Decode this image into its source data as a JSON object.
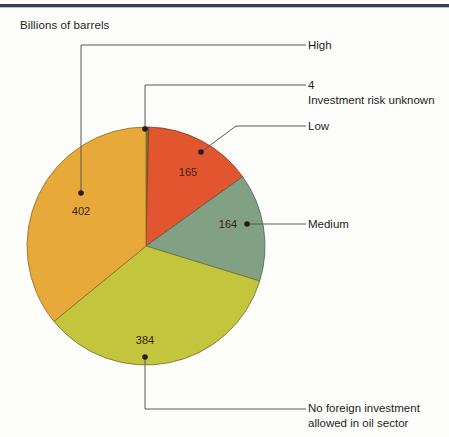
{
  "figure": {
    "axis_title": "Billions of barrels",
    "top_rule_color": "#2e4057",
    "background": "#fdfdfc"
  },
  "chart_data": {
    "type": "pie",
    "title": "",
    "subtitle": "",
    "xlabel": "",
    "ylabel": "Billions of barrels",
    "units": "billions of barrels",
    "total": 1119,
    "legend": "callout-labels",
    "grid": false,
    "start_angle_deg": 0,
    "direction": "clockwise",
    "categories": [
      "Investment risk unknown",
      "Low",
      "Medium",
      "No foreign investment allowed in oil sector",
      "High"
    ],
    "values": [
      4,
      165,
      164,
      384,
      402
    ],
    "labels": [
      "4",
      "165",
      "164",
      "384",
      "402"
    ],
    "colors": [
      "#7d7420",
      "#e2562f",
      "#82a084",
      "#c3c53c",
      "#e8a93b"
    ],
    "slices": [
      {
        "name": "Investment risk unknown",
        "value": 4,
        "label": "4",
        "color": "#7d7420",
        "callout": "Investment risk unknown",
        "percent": 0.4
      },
      {
        "name": "Low",
        "value": 165,
        "label": "165",
        "color": "#e2562f",
        "callout": "Low",
        "percent": 14.7
      },
      {
        "name": "Medium",
        "value": 164,
        "label": "164",
        "color": "#82a084",
        "callout": "Medium",
        "percent": 14.7
      },
      {
        "name": "No foreign investment allowed in oil sector",
        "value": 384,
        "label": "384",
        "color": "#c3c53c",
        "callout": "No foreign investment allowed in oil sector",
        "percent": 34.3
      },
      {
        "name": "High",
        "value": 402,
        "label": "402",
        "color": "#e8a93b",
        "callout": "High",
        "percent": 35.9
      }
    ]
  },
  "callouts": {
    "high": "High",
    "unknown_value": "4",
    "unknown_label": "Investment risk unknown",
    "low": "Low",
    "medium": "Medium",
    "no_foreign_line1": "No foreign investment",
    "no_foreign_line2": "allowed in oil sector"
  },
  "slice_labels": {
    "high": "402",
    "low": "165",
    "medium": "164",
    "no_foreign": "384"
  }
}
